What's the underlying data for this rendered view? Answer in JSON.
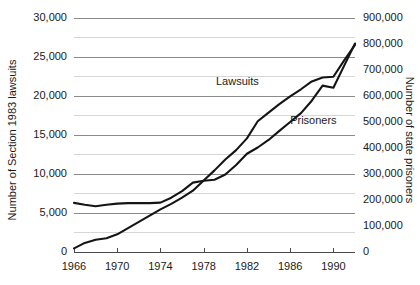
{
  "chart_data": {
    "type": "line",
    "title": "",
    "subtitle": "",
    "xlabel": "",
    "ylabel": "Number of Section 1983 lawsuits",
    "y2label": "Number of state prisoners",
    "xlim": [
      1966,
      1992
    ],
    "ylim": [
      0,
      30000
    ],
    "y2lim": [
      0,
      900000
    ],
    "grid": true,
    "legend_position": "inline-annotation",
    "x_ticks": [
      1966,
      1970,
      1974,
      1978,
      1982,
      1986,
      1990
    ],
    "x_tick_labels": [
      "1966",
      "1970",
      "1974",
      "1978",
      "1982",
      "1986",
      "1990"
    ],
    "y_ticks": [
      0,
      5000,
      10000,
      15000,
      20000,
      25000,
      30000
    ],
    "y_tick_labels": [
      "0",
      "5,000",
      "10,000",
      "15,000",
      "20,000",
      "25,000",
      "30,000"
    ],
    "y_minor_ticks": [
      2500,
      7500,
      12500,
      17500,
      22500,
      27500
    ],
    "y2_ticks": [
      0,
      100000,
      200000,
      300000,
      400000,
      500000,
      600000,
      700000,
      800000,
      900000
    ],
    "y2_tick_labels": [
      "0",
      "100,000",
      "200,000",
      "300,000",
      "400,000",
      "500,000",
      "600,000",
      "700,000",
      "800,000",
      "900,000"
    ],
    "series": [
      {
        "name": "Lawsuits",
        "axis": "left",
        "annotation_label": "Lawsuits",
        "annotation_x": 1983.1,
        "annotation_y": 21300,
        "color": "#151515",
        "x": [
          1966,
          1967,
          1968,
          1969,
          1970,
          1971,
          1972,
          1973,
          1974,
          1975,
          1976,
          1977,
          1978,
          1979,
          1980,
          1981,
          1982,
          1983,
          1984,
          1985,
          1986,
          1987,
          1988,
          1989,
          1990,
          1991,
          1992
        ],
        "values": [
          400,
          1100,
          1500,
          1700,
          2200,
          3000,
          3800,
          4600,
          5400,
          6100,
          6900,
          7800,
          9100,
          10400,
          11800,
          13000,
          14500,
          16700,
          17800,
          18900,
          19900,
          20800,
          21800,
          22300,
          22400,
          24500,
          26500
        ]
      },
      {
        "name": "Prisoners",
        "axis": "right",
        "annotation_label": "Prisoners",
        "annotation_x": 1990.3,
        "annotation_y": 490000,
        "color": "#151515",
        "x": [
          1966,
          1967,
          1968,
          1969,
          1970,
          1971,
          1972,
          1973,
          1974,
          1975,
          1976,
          1977,
          1978,
          1979,
          1980,
          1981,
          1982,
          1983,
          1984,
          1985,
          1986,
          1987,
          1988,
          1989,
          1990,
          1991,
          1992
        ],
        "values": [
          187000,
          180000,
          174000,
          180000,
          184000,
          186000,
          186000,
          186000,
          188000,
          207000,
          232000,
          265000,
          272000,
          276000,
          296000,
          333000,
          376000,
          400000,
          429000,
          464000,
          498000,
          532000,
          580000,
          638000,
          630000,
          715000,
          800000
        ]
      }
    ]
  }
}
